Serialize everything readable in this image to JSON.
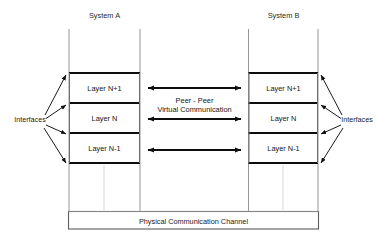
{
  "diagram": {
    "title_left": "System A",
    "title_right": "System B",
    "interfaces_left": "Interfaces",
    "interfaces_right": "Interfaces",
    "peer_line1": "Peer - Peer",
    "peer_line2": "Virtual Communication",
    "channel_label": "Physical Communication Channel",
    "layers_left": [
      {
        "label": "Layer N+1"
      },
      {
        "label": "Layer N"
      },
      {
        "label": "Layer N-1"
      }
    ],
    "layers_right": [
      {
        "label": "Layer N+1"
      },
      {
        "label": "Layer N"
      },
      {
        "label": "Layer N-1"
      }
    ],
    "colors": {
      "ink": "#0d0d0d",
      "frame": "#5c5c5c",
      "thin": "#8a8a8a",
      "background": "#ffffff"
    }
  }
}
